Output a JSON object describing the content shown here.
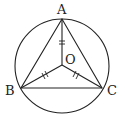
{
  "diagram": {
    "type": "geometry",
    "labels": {
      "A": "A",
      "B": "B",
      "C": "C",
      "O": "O"
    },
    "points": {
      "A": [
        62,
        19
      ],
      "B": [
        21,
        88
      ],
      "C": [
        102,
        88
      ],
      "O": [
        62,
        65
      ]
    },
    "circle": {
      "cx": 62,
      "cy": 66,
      "r": 47
    },
    "stroke_color": "#222222"
  }
}
